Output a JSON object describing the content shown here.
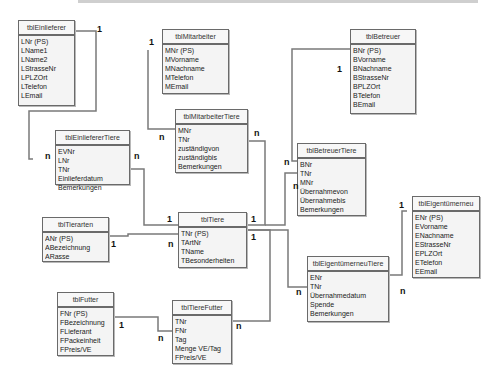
{
  "tables": {
    "einlieferer": {
      "title": "tblEinlieferer",
      "fields": [
        "LNr (PS)",
        "LName1",
        "LName2",
        "LStrasseNr",
        "LPLZOrt",
        "LTelefon",
        "LEmail"
      ]
    },
    "mitarbeiter": {
      "title": "tblMitarbeiter",
      "fields": [
        "MNr (PS)",
        "MVorname",
        "MNachname",
        "MTelefon",
        "MEmail"
      ]
    },
    "betreuer": {
      "title": "tblBetreuer",
      "fields": [
        "BNr (PS)",
        "BVorname",
        "BNachname",
        "BStrasseNr",
        "BPLZOrt",
        "BTelefon",
        "BEmail"
      ]
    },
    "mitarbeiterTiere": {
      "title": "tblMitarbeiterTiere",
      "fields": [
        "MNr",
        "TNr",
        "zuständigvon",
        "zuständigbis",
        "Bemerkungen"
      ]
    },
    "einliefererTiere": {
      "title": "tblEinliefererTiere",
      "fields": [
        "EVNr",
        "LNr",
        "TNr",
        "Einlieferdatum",
        "Bemerkungen"
      ]
    },
    "betreuerTiere": {
      "title": "tblBetreuerTiere",
      "fields": [
        "BNr",
        "TNr",
        "MNr",
        "Übernahmevon",
        "Übernahmebis",
        "Bemerkungen"
      ]
    },
    "eigentuemerneu": {
      "title": "tblEigentümerneu",
      "fields": [
        "ENr (PS)",
        "EVorname",
        "ENachname",
        "EStrasseNr",
        "EPLZOrt",
        "ETelefon",
        "EEmail"
      ]
    },
    "tierarten": {
      "title": "tblTierarten",
      "fields": [
        "ANr (PS)",
        "ABezeichnung",
        "ARasse"
      ]
    },
    "tiere": {
      "title": "tblTiere",
      "fields": [
        "TNr (PS)",
        "TArtNr",
        "TName",
        "TBesonderheiten"
      ]
    },
    "eigentuemerneuTiere": {
      "title": "tblEigentümerneuTiere",
      "fields": [
        "ENr",
        "TNr",
        "Übernahmedatum",
        "Spende",
        "Bemerkungen"
      ]
    },
    "futter": {
      "title": "tblFutter",
      "fields": [
        "FNr (PS)",
        "FBezeichnung",
        "FLieferant",
        "FPackeinheit",
        "FPreis/VE"
      ]
    },
    "tiereFutter": {
      "title": "tblTiereFutter",
      "fields": [
        "TNr",
        "FNr",
        "Tag",
        "Menge VE/Tag",
        "FPreis/VE"
      ]
    }
  },
  "cardinalities": {
    "einlieferer_one": "1",
    "einlieferer_many": "n",
    "mitarbeiter_one": "1",
    "mitarbeiter_many": "n",
    "mt_tnr_many": "n",
    "et_tnr_many": "n",
    "betreuer_one": "1",
    "bt_bnr_many": "n",
    "bt_tnr_many": "n",
    "tiere_left_one": "1",
    "tiere_right_one": "1",
    "tiere_right_one2": "1",
    "tiere_tartnr_many": "n",
    "tierarten_one": "1",
    "eigentuemer_one": "1",
    "et2_tnr_many": "n",
    "et2_enr_many": "n",
    "futter_one": "1",
    "tf_fnr_many": "n",
    "tf_tnr_many": "n"
  },
  "colors": {
    "line": "#7a7a7a",
    "border": "#6a6a6a",
    "box": "#f4f4f4"
  }
}
